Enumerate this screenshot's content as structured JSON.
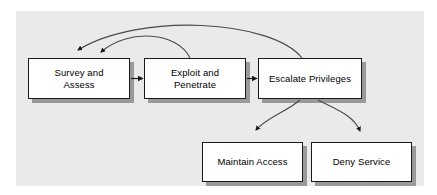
{
  "diagram": {
    "canvas": {
      "background_color": "#eaeaea",
      "page_background_color": "#ffffff"
    },
    "style": {
      "node_fill": "#ffffff",
      "node_border": "#1a1a1a",
      "node_shadow": "#9a9a9a",
      "edge_color": "#3a3a3a",
      "text_color": "#000000"
    },
    "nodes": [
      {
        "id": "survey",
        "label": "Survey and\nAssess",
        "x": 28,
        "y": 58,
        "w": 102,
        "h": 41
      },
      {
        "id": "exploit",
        "label": "Exploit and\nPenetrate",
        "x": 144,
        "y": 58,
        "w": 102,
        "h": 41
      },
      {
        "id": "escalate",
        "label": "Escalate Privileges",
        "x": 258,
        "y": 58,
        "w": 104,
        "h": 41
      },
      {
        "id": "maintain",
        "label": "Maintain Access",
        "x": 202,
        "y": 142,
        "w": 101,
        "h": 40
      },
      {
        "id": "deny",
        "label": "Deny Service",
        "x": 311,
        "y": 142,
        "w": 101,
        "h": 40
      }
    ],
    "edges": [
      {
        "id": "survey-to-exploit",
        "from": "survey",
        "to": "exploit",
        "kind": "straight-arrow"
      },
      {
        "id": "exploit-to-escalate",
        "from": "exploit",
        "to": "escalate",
        "kind": "straight-arrow"
      },
      {
        "id": "exploit-back-to-survey",
        "from": "exploit",
        "to": "survey",
        "kind": "curved-feedback"
      },
      {
        "id": "escalate-back-to-survey",
        "from": "escalate",
        "to": "survey",
        "kind": "curved-feedback"
      },
      {
        "id": "escalate-to-maintain",
        "from": "escalate",
        "to": "maintain",
        "kind": "curved-arrow"
      },
      {
        "id": "escalate-to-deny",
        "from": "escalate",
        "to": "deny",
        "kind": "curved-arrow"
      }
    ]
  }
}
